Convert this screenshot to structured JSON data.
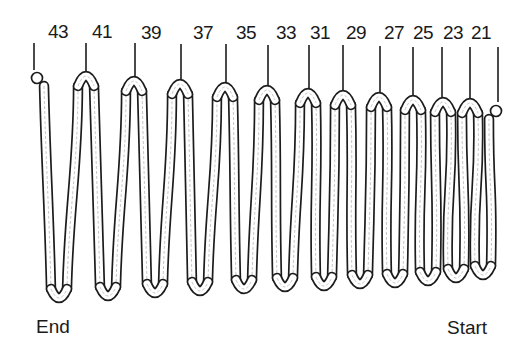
{
  "diagram": {
    "type": "coil-spring",
    "end_label": "End",
    "start_label": "Start",
    "colors": {
      "outline": "#1c1c1c",
      "tube_fill": "#ffffff",
      "inner_detail": "#9a9a9a",
      "text": "#1a1a1a"
    },
    "coil_labels": [
      {
        "text": "43",
        "x": 48,
        "y": 22
      },
      {
        "text": "41",
        "x": 92,
        "y": 22
      },
      {
        "text": "39",
        "x": 141,
        "y": 23
      },
      {
        "text": "37",
        "x": 193,
        "y": 23
      },
      {
        "text": "35",
        "x": 236,
        "y": 23
      },
      {
        "text": "33",
        "x": 276,
        "y": 23
      },
      {
        "text": "31",
        "x": 310,
        "y": 23
      },
      {
        "text": "29",
        "x": 346,
        "y": 23
      },
      {
        "text": "27",
        "x": 384,
        "y": 23
      },
      {
        "text": "25",
        "x": 413,
        "y": 23
      },
      {
        "text": "23",
        "x": 443,
        "y": 23
      },
      {
        "text": "21",
        "x": 471,
        "y": 23
      }
    ],
    "ticks": [
      {
        "x": 34,
        "y1": 43,
        "y2": 70
      },
      {
        "x": 86,
        "y1": 43,
        "y2": 72
      },
      {
        "x": 135,
        "y1": 43,
        "y2": 77
      },
      {
        "x": 181,
        "y1": 44,
        "y2": 80
      },
      {
        "x": 226,
        "y1": 44,
        "y2": 83
      },
      {
        "x": 268,
        "y1": 45,
        "y2": 86
      },
      {
        "x": 309,
        "y1": 45,
        "y2": 89
      },
      {
        "x": 343,
        "y1": 45,
        "y2": 91
      },
      {
        "x": 380,
        "y1": 46,
        "y2": 93
      },
      {
        "x": 413,
        "y1": 47,
        "y2": 96
      },
      {
        "x": 442,
        "y1": 47,
        "y2": 98
      },
      {
        "x": 470,
        "y1": 47,
        "y2": 99
      },
      {
        "x": 498,
        "y1": 47,
        "y2": 102
      }
    ],
    "peaks": [
      {
        "x": 36,
        "y": 76
      },
      {
        "x": 86,
        "y": 76
      },
      {
        "x": 134,
        "y": 81
      },
      {
        "x": 180,
        "y": 84
      },
      {
        "x": 225,
        "y": 87
      },
      {
        "x": 267,
        "y": 90
      },
      {
        "x": 308,
        "y": 93
      },
      {
        "x": 343,
        "y": 95
      },
      {
        "x": 379,
        "y": 97
      },
      {
        "x": 413,
        "y": 100
      },
      {
        "x": 443,
        "y": 102
      },
      {
        "x": 470,
        "y": 103
      },
      {
        "x": 497,
        "y": 109
      }
    ],
    "troughs": [
      {
        "x": 59,
        "y": 297
      },
      {
        "x": 108,
        "y": 295
      },
      {
        "x": 155,
        "y": 292
      },
      {
        "x": 200,
        "y": 290
      },
      {
        "x": 244,
        "y": 288
      },
      {
        "x": 285,
        "y": 286
      },
      {
        "x": 324,
        "y": 285
      },
      {
        "x": 360,
        "y": 283
      },
      {
        "x": 395,
        "y": 282
      },
      {
        "x": 428,
        "y": 280
      },
      {
        "x": 456,
        "y": 277
      },
      {
        "x": 483,
        "y": 274
      }
    ]
  }
}
